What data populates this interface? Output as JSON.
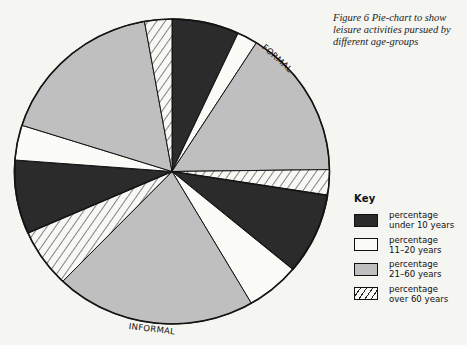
{
  "caption": "Figure 6  Pie-chart to show leisure activities pursued by different age-groups",
  "colors": {
    "under_10": "#2b2b2b",
    "age_11_20": "#fbfbf8",
    "age_21_60": "#bfbfbf",
    "over_60": "#f8f8f5",
    "outline": "#141414",
    "background": "#f5f5f2"
  },
  "key": {
    "title": "Key",
    "items": [
      {
        "label": "percentage\nunder 10 years",
        "style": "solid-dark"
      },
      {
        "label": "percentage\n11–20 years",
        "style": "solid-white"
      },
      {
        "label": "percentage\n21–60 years",
        "style": "solid-gray"
      },
      {
        "label": "percentage\nover 60 years",
        "style": "hatched"
      }
    ]
  },
  "chart_data": {
    "type": "pie",
    "title": "Figure 6 Pie-chart to show leisure activities pursued by different age-groups",
    "start_angle_deg": 0,
    "direction": "clockwise",
    "group_labels": [
      {
        "text": "FORMAL",
        "angle_deg": 42
      },
      {
        "text": "INFORMAL",
        "angle_deg": 187
      }
    ],
    "legend": [
      "percentage under 10 years",
      "percentage 11–20 years",
      "percentage 21–60 years",
      "percentage over 60 years"
    ],
    "legend_position": "right",
    "slices": [
      {
        "group": "FORMAL",
        "category": "under 10 years",
        "value": 6.9
      },
      {
        "group": "FORMAL",
        "category": "11–20 years",
        "value": 2.1
      },
      {
        "group": "FORMAL",
        "category": "21–60 years",
        "value": 15.8
      },
      {
        "group": "FORMAL",
        "category": "over 60 years",
        "value": 2.7
      },
      {
        "group": "INFORMAL",
        "category": "under 10 years",
        "value": 8.6
      },
      {
        "group": "INFORMAL",
        "category": "11–20 years",
        "value": 5.5
      },
      {
        "group": "INFORMAL",
        "category": "21–60 years",
        "value": 20.6
      },
      {
        "group": "INFORMAL",
        "category": "over 60 years",
        "value": 6.2
      },
      {
        "group": "other",
        "category": "under 10 years",
        "value": 7.8
      },
      {
        "group": "other",
        "category": "11–20 years",
        "value": 3.7
      },
      {
        "group": "other",
        "category": "21–60 years",
        "value": 17.3
      },
      {
        "group": "other",
        "category": "over 60 years",
        "value": 2.8
      }
    ]
  }
}
